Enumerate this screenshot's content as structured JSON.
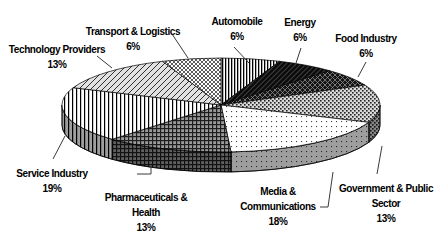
{
  "chart_data": {
    "type": "pie",
    "projection": "3d",
    "title": "",
    "unit": "%",
    "direction": "clockwise",
    "start_angle_deg": 0,
    "legend": "none (labels with leader lines around pie)",
    "slices": [
      {
        "label": "Automobile",
        "value": 6,
        "pattern": "vlines-fine"
      },
      {
        "label": "Energy",
        "value": 6,
        "pattern": "black-diag"
      },
      {
        "label": "Food Industry",
        "value": 6,
        "pattern": "dark-diamond"
      },
      {
        "label": "Government & Public Sector",
        "value": 13,
        "pattern": "gray-speckle"
      },
      {
        "label": "Media & Communications",
        "value": 18,
        "pattern": "light-dots"
      },
      {
        "label": "Pharmaceuticals & Health",
        "value": 13,
        "pattern": "dark-plaid"
      },
      {
        "label": "Service Industry",
        "value": 19,
        "pattern": "vlines-wide"
      },
      {
        "label": "Technology Providers",
        "value": 13,
        "pattern": "light-diag"
      },
      {
        "label": "Transport & Logistics",
        "value": 6,
        "pattern": "light-diamond"
      }
    ],
    "geometry_hint": {
      "cx": 221,
      "cy": 105,
      "rx": 159,
      "ry": 47,
      "depth": 20
    }
  },
  "labels": [
    {
      "slice": 0,
      "lines": [
        "Automobile"
      ],
      "x": 237,
      "top": 14,
      "leader": [
        [
          234,
          47
        ],
        [
          249,
          63
        ]
      ]
    },
    {
      "slice": 1,
      "lines": [
        "Energy"
      ],
      "x": 300,
      "top": 15,
      "leader": [
        [
          301,
          48
        ],
        [
          295,
          66
        ]
      ]
    },
    {
      "slice": 2,
      "lines": [
        "Food Industry"
      ],
      "x": 366,
      "top": 31,
      "leader": [
        [
          366,
          62
        ],
        [
          358,
          77
        ]
      ]
    },
    {
      "slice": 3,
      "lines": [
        "Government & Public",
        "Sector"
      ],
      "x": 386,
      "top": 181,
      "leader": [
        [
          382,
          146
        ],
        [
          377,
          174
        ]
      ]
    },
    {
      "slice": 4,
      "lines": [
        "Media &",
        "Communications"
      ],
      "x": 278,
      "top": 184,
      "leader": [
        [
          320,
          207
        ],
        [
          328,
          207
        ],
        [
          333,
          172
        ]
      ]
    },
    {
      "slice": 5,
      "lines": [
        "Pharmaceuticals &",
        "Health"
      ],
      "x": 146,
      "top": 190,
      "leader": [
        [
          137,
          174
        ],
        [
          151,
          174
        ],
        [
          151,
          167
        ]
      ]
    },
    {
      "slice": 6,
      "lines": [
        "Service Industry"
      ],
      "x": 52,
      "top": 166,
      "leader": [
        [
          53,
          159
        ],
        [
          65,
          136
        ]
      ]
    },
    {
      "slice": 7,
      "lines": [
        "Technology Providers"
      ],
      "x": 57,
      "top": 42,
      "leader": [
        [
          97,
          56
        ],
        [
          112,
          68
        ]
      ]
    },
    {
      "slice": 8,
      "lines": [
        "Transport & Logistics"
      ],
      "x": 133,
      "top": 24,
      "leader": [
        [
          172,
          34
        ],
        [
          188,
          58
        ]
      ]
    }
  ],
  "styles": {
    "background": "#ffffff",
    "label_color": "#000000",
    "outline_color": "#000000",
    "leader_color": "#3a3a3a",
    "rim_shade_opacity": 0.38
  }
}
